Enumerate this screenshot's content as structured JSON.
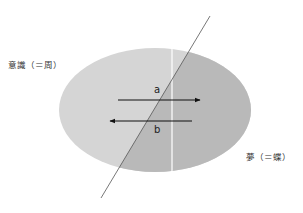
{
  "labels": {
    "left": "意識（＝周）",
    "right": "夢（＝蝶）",
    "arrow_a": "a",
    "arrow_b": "b"
  },
  "colors": {
    "light_region": "#d5d5d5",
    "dark_region": "#b9b9b9",
    "line": "#555555",
    "arrow": "#111111",
    "divider": "#ffffff"
  }
}
